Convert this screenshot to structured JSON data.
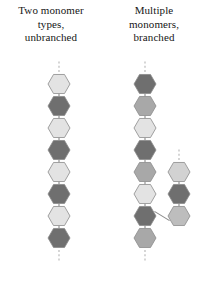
{
  "figure": {
    "background": "#ffffff"
  },
  "palette": {
    "very_light": "#e3e3e3",
    "light": "#d2d2d2",
    "medium_light": "#bdbdbd",
    "medium": "#a8a8a8",
    "medium_dark": "#8f8f8f",
    "dark": "#6f6f6f",
    "outline": "#8a8a8a",
    "bond": "#8a8a8a",
    "dash": "#b4b4b4",
    "text": "#161616"
  },
  "panels": [
    {
      "id": "left",
      "caption_lines": [
        "Two monomer",
        "types,",
        "unbranched"
      ],
      "chains": [
        {
          "id": "main-chain",
          "name": "unbranched-main-chain",
          "dash_top": true,
          "dash_bottom": true,
          "monomers": [
            {
              "index": 1,
              "type": "A",
              "shade": "very_light",
              "cx": 59,
              "cy": 84
            },
            {
              "index": 2,
              "type": "B",
              "shade": "dark",
              "cx": 59,
              "cy": 106
            },
            {
              "index": 3,
              "type": "A",
              "shade": "very_light",
              "cx": 59,
              "cy": 128
            },
            {
              "index": 4,
              "type": "B",
              "shade": "dark",
              "cx": 59,
              "cy": 150
            },
            {
              "index": 5,
              "type": "A",
              "shade": "very_light",
              "cx": 59,
              "cy": 172
            },
            {
              "index": 6,
              "type": "B",
              "shade": "dark",
              "cx": 59,
              "cy": 194
            },
            {
              "index": 7,
              "type": "A",
              "shade": "very_light",
              "cx": 59,
              "cy": 216
            },
            {
              "index": 8,
              "type": "B",
              "shade": "dark",
              "cx": 59,
              "cy": 238
            }
          ]
        }
      ]
    },
    {
      "id": "right",
      "caption_lines": [
        "Multiple",
        "monomers,",
        "branched"
      ],
      "chains": [
        {
          "id": "main-chain",
          "name": "branched-main-chain",
          "dash_top": true,
          "dash_bottom": true,
          "monomers": [
            {
              "index": 1,
              "type": "C",
              "shade": "dark",
              "cx": 42,
              "cy": 84
            },
            {
              "index": 2,
              "type": "B",
              "shade": "medium",
              "cx": 42,
              "cy": 106
            },
            {
              "index": 3,
              "type": "A",
              "shade": "very_light",
              "cx": 42,
              "cy": 128
            },
            {
              "index": 4,
              "type": "C",
              "shade": "dark",
              "cx": 42,
              "cy": 150
            },
            {
              "index": 5,
              "type": "B",
              "shade": "medium",
              "cx": 42,
              "cy": 172
            },
            {
              "index": 6,
              "type": "A",
              "shade": "very_light",
              "cx": 42,
              "cy": 194
            },
            {
              "index": 7,
              "type": "C",
              "shade": "dark",
              "cx": 42,
              "cy": 216
            },
            {
              "index": 8,
              "type": "B",
              "shade": "medium",
              "cx": 42,
              "cy": 238
            }
          ]
        },
        {
          "id": "branch-chain",
          "name": "branched-side-chain",
          "dash_top": true,
          "dash_bottom": false,
          "attaches_to": {
            "chain": "main-chain",
            "monomer_index": 7
          },
          "monomers": [
            {
              "index": 1,
              "type": "A",
              "shade": "light",
              "cx": 76,
              "cy": 172
            },
            {
              "index": 2,
              "type": "C",
              "shade": "dark",
              "cx": 76,
              "cy": 194
            },
            {
              "index": 3,
              "type": "B",
              "shade": "medium_light",
              "cx": 76,
              "cy": 216
            }
          ]
        }
      ]
    }
  ],
  "geometry": {
    "hex_radius": 11,
    "hex_spacing": 22,
    "bond_width": 1.1,
    "dash_length": 12,
    "dash_pattern": "2,2.2"
  }
}
